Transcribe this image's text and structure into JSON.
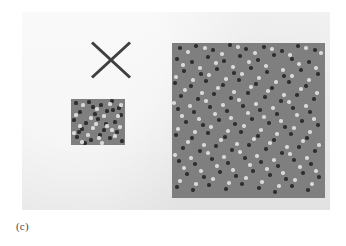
{
  "figure": {
    "caption": "(c)",
    "panel_background_color": "#ececec",
    "page_background_color": "#ffffff"
  },
  "x_mark": {
    "name": "x-mark",
    "stroke_color": "#3f3f3f",
    "stroke_width": 3,
    "left": 68,
    "top": 29,
    "width": 42,
    "height": 38
  },
  "squares": [
    {
      "id": "small-square",
      "label": "small textured square",
      "left": 49,
      "top": 87,
      "width": 54,
      "height": 46,
      "fill_color": "#7f7f7f",
      "dark_dot_color": "#2f2f2f",
      "light_dot_color": "#d9d9d9",
      "dot_radius": 1.6,
      "dot_count": 26
    },
    {
      "id": "large-square",
      "label": "large textured square",
      "left": 150,
      "top": 31,
      "width": 153,
      "height": 155,
      "fill_color": "#7f7f7f",
      "dark_dot_color": "#2f2f2f",
      "light_dot_color": "#d9d9d9",
      "dot_radius": 1.7,
      "dot_count": 210
    }
  ],
  "chart_data": {
    "type": "scatter",
    "title": "(c)",
    "xlabel": "",
    "ylabel": "",
    "series": [
      {
        "name": "small-square-dark-dots",
        "color": "#2f2f2f",
        "points": [
          [
            5,
            4
          ],
          [
            18,
            3
          ],
          [
            30,
            6
          ],
          [
            41,
            2
          ],
          [
            48,
            9
          ],
          [
            9,
            13
          ],
          [
            24,
            15
          ],
          [
            36,
            12
          ],
          [
            50,
            16
          ],
          [
            3,
            21
          ],
          [
            15,
            24
          ],
          [
            27,
            20
          ],
          [
            44,
            23
          ],
          [
            11,
            30
          ],
          [
            33,
            31
          ],
          [
            46,
            33
          ],
          [
            6,
            38
          ],
          [
            20,
            41
          ],
          [
            39,
            39
          ],
          [
            51,
            42
          ],
          [
            14,
            44
          ],
          [
            29,
            36
          ],
          [
            42,
            11
          ],
          [
            22,
            8
          ],
          [
            8,
            33
          ],
          [
            35,
            25
          ]
        ]
      },
      {
        "name": "small-square-light-dots",
        "color": "#d9d9d9",
        "points": [
          [
            12,
            6
          ],
          [
            26,
            10
          ],
          [
            39,
            5
          ],
          [
            47,
            17
          ],
          [
            5,
            16
          ],
          [
            20,
            19
          ],
          [
            33,
            17
          ],
          [
            9,
            27
          ],
          [
            22,
            29
          ],
          [
            36,
            27
          ],
          [
            49,
            28
          ],
          [
            3,
            34
          ],
          [
            17,
            36
          ],
          [
            28,
            39
          ],
          [
            44,
            37
          ],
          [
            11,
            43
          ],
          [
            31,
            44
          ],
          [
            41,
            31
          ],
          [
            25,
            25
          ],
          [
            50,
            6
          ]
        ]
      },
      {
        "name": "large-square-dark-dots",
        "color": "#2f2f2f",
        "points": [
          [
            8,
            5
          ],
          [
            24,
            3
          ],
          [
            41,
            7
          ],
          [
            58,
            2
          ],
          [
            74,
            6
          ],
          [
            92,
            4
          ],
          [
            110,
            8
          ],
          [
            126,
            3
          ],
          [
            143,
            7
          ],
          [
            5,
            16
          ],
          [
            20,
            19
          ],
          [
            36,
            14
          ],
          [
            52,
            18
          ],
          [
            68,
            13
          ],
          [
            86,
            17
          ],
          [
            102,
            12
          ],
          [
            120,
            16
          ],
          [
            137,
            19
          ],
          [
            12,
            28
          ],
          [
            29,
            31
          ],
          [
            45,
            26
          ],
          [
            62,
            30
          ],
          [
            79,
            25
          ],
          [
            95,
            29
          ],
          [
            112,
            33
          ],
          [
            129,
            27
          ],
          [
            146,
            31
          ],
          [
            3,
            40
          ],
          [
            19,
            43
          ],
          [
            34,
            38
          ],
          [
            51,
            42
          ],
          [
            67,
            37
          ],
          [
            84,
            41
          ],
          [
            100,
            45
          ],
          [
            117,
            39
          ],
          [
            134,
            43
          ],
          [
            9,
            53
          ],
          [
            26,
            56
          ],
          [
            42,
            51
          ],
          [
            59,
            55
          ],
          [
            76,
            50
          ],
          [
            93,
            54
          ],
          [
            109,
            58
          ],
          [
            125,
            52
          ],
          [
            142,
            56
          ],
          [
            6,
            66
          ],
          [
            22,
            69
          ],
          [
            38,
            64
          ],
          [
            55,
            68
          ],
          [
            71,
            63
          ],
          [
            88,
            67
          ],
          [
            105,
            71
          ],
          [
            121,
            65
          ],
          [
            138,
            69
          ],
          [
            14,
            79
          ],
          [
            31,
            82
          ],
          [
            47,
            77
          ],
          [
            63,
            81
          ],
          [
            80,
            76
          ],
          [
            97,
            80
          ],
          [
            113,
            84
          ],
          [
            130,
            78
          ],
          [
            146,
            82
          ],
          [
            4,
            92
          ],
          [
            20,
            95
          ],
          [
            36,
            90
          ],
          [
            53,
            94
          ],
          [
            69,
            89
          ],
          [
            86,
            93
          ],
          [
            102,
            97
          ],
          [
            119,
            91
          ],
          [
            135,
            95
          ],
          [
            11,
            105
          ],
          [
            28,
            108
          ],
          [
            44,
            103
          ],
          [
            60,
            107
          ],
          [
            77,
            102
          ],
          [
            94,
            106
          ],
          [
            110,
            110
          ],
          [
            127,
            104
          ],
          [
            143,
            108
          ],
          [
            7,
            118
          ],
          [
            23,
            121
          ],
          [
            40,
            116
          ],
          [
            56,
            120
          ],
          [
            73,
            115
          ],
          [
            89,
            119
          ],
          [
            106,
            123
          ],
          [
            122,
            117
          ],
          [
            139,
            121
          ],
          [
            15,
            131
          ],
          [
            32,
            134
          ],
          [
            48,
            129
          ],
          [
            64,
            133
          ],
          [
            81,
            128
          ],
          [
            98,
            132
          ],
          [
            114,
            136
          ],
          [
            131,
            130
          ],
          [
            147,
            134
          ],
          [
            5,
            144
          ],
          [
            21,
            147
          ],
          [
            37,
            142
          ],
          [
            54,
            146
          ],
          [
            70,
            141
          ],
          [
            87,
            145
          ],
          [
            103,
            149
          ],
          [
            120,
            143
          ],
          [
            136,
            147
          ]
        ]
      },
      {
        "name": "large-square-light-dots",
        "color": "#d9d9d9",
        "points": [
          [
            16,
            9
          ],
          [
            33,
            5
          ],
          [
            50,
            11
          ],
          [
            66,
            4
          ],
          [
            83,
            10
          ],
          [
            100,
            6
          ],
          [
            118,
            12
          ],
          [
            134,
            5
          ],
          [
            149,
            10
          ],
          [
            11,
            22
          ],
          [
            28,
            25
          ],
          [
            44,
            20
          ],
          [
            61,
            24
          ],
          [
            77,
            19
          ],
          [
            94,
            23
          ],
          [
            111,
            27
          ],
          [
            127,
            21
          ],
          [
            144,
            25
          ],
          [
            4,
            34
          ],
          [
            21,
            37
          ],
          [
            37,
            32
          ],
          [
            54,
            36
          ],
          [
            70,
            31
          ],
          [
            87,
            35
          ],
          [
            104,
            39
          ],
          [
            120,
            33
          ],
          [
            137,
            37
          ],
          [
            13,
            47
          ],
          [
            30,
            50
          ],
          [
            46,
            45
          ],
          [
            62,
            49
          ],
          [
            79,
            44
          ],
          [
            96,
            48
          ],
          [
            112,
            52
          ],
          [
            129,
            46
          ],
          [
            145,
            50
          ],
          [
            2,
            60
          ],
          [
            18,
            63
          ],
          [
            34,
            58
          ],
          [
            51,
            62
          ],
          [
            67,
            57
          ],
          [
            84,
            61
          ],
          [
            101,
            65
          ],
          [
            117,
            59
          ],
          [
            134,
            63
          ],
          [
            10,
            73
          ],
          [
            27,
            76
          ],
          [
            43,
            71
          ],
          [
            59,
            75
          ],
          [
            76,
            70
          ],
          [
            92,
            74
          ],
          [
            109,
            78
          ],
          [
            125,
            72
          ],
          [
            142,
            76
          ],
          [
            6,
            86
          ],
          [
            23,
            89
          ],
          [
            39,
            84
          ],
          [
            56,
            88
          ],
          [
            72,
            83
          ],
          [
            89,
            87
          ],
          [
            105,
            91
          ],
          [
            122,
            85
          ],
          [
            138,
            89
          ],
          [
            16,
            99
          ],
          [
            32,
            102
          ],
          [
            49,
            97
          ],
          [
            65,
            101
          ],
          [
            82,
            96
          ],
          [
            98,
            100
          ],
          [
            115,
            104
          ],
          [
            131,
            98
          ],
          [
            147,
            102
          ],
          [
            3,
            112
          ],
          [
            19,
            115
          ],
          [
            36,
            110
          ],
          [
            52,
            114
          ],
          [
            68,
            109
          ],
          [
            85,
            113
          ],
          [
            102,
            117
          ],
          [
            118,
            111
          ],
          [
            135,
            115
          ],
          [
            12,
            125
          ],
          [
            29,
            128
          ],
          [
            45,
            123
          ],
          [
            61,
            127
          ],
          [
            78,
            122
          ],
          [
            95,
            126
          ],
          [
            111,
            130
          ],
          [
            128,
            124
          ],
          [
            144,
            128
          ],
          [
            8,
            138
          ],
          [
            24,
            141
          ],
          [
            41,
            136
          ],
          [
            57,
            140
          ],
          [
            74,
            135
          ],
          [
            90,
            139
          ],
          [
            107,
            143
          ],
          [
            123,
            137
          ],
          [
            140,
            141
          ]
        ]
      }
    ]
  }
}
